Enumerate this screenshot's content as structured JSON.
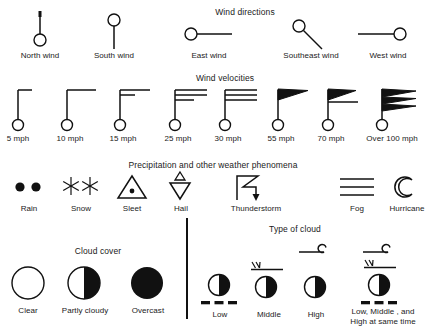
{
  "sections": [
    {
      "id": "wind-directions",
      "title": "Wind directions",
      "items": [
        {
          "id": "north-wind",
          "label": "North wind",
          "icon": "wind-direction-north-icon"
        },
        {
          "id": "south-wind",
          "label": "South wind",
          "icon": "wind-direction-south-icon"
        },
        {
          "id": "east-wind",
          "label": "East wind",
          "icon": "wind-direction-east-icon"
        },
        {
          "id": "southeast-wind",
          "label": "Southeast wind",
          "icon": "wind-direction-southeast-icon"
        },
        {
          "id": "west-wind",
          "label": "West wind",
          "icon": "wind-direction-west-icon"
        }
      ]
    },
    {
      "id": "wind-velocities",
      "title": "Wind velocities",
      "items": [
        {
          "id": "v5",
          "label": "5 mph",
          "icon": "wind-barb-5-icon"
        },
        {
          "id": "v10",
          "label": "10 mph",
          "icon": "wind-barb-10-icon"
        },
        {
          "id": "v15",
          "label": "15 mph",
          "icon": "wind-barb-15-icon"
        },
        {
          "id": "v25",
          "label": "25 mph",
          "icon": "wind-barb-25-icon"
        },
        {
          "id": "v30",
          "label": "30 mph",
          "icon": "wind-barb-30-icon"
        },
        {
          "id": "v55",
          "label": "55 mph",
          "icon": "wind-barb-55-icon"
        },
        {
          "id": "v70",
          "label": "70 mph",
          "icon": "wind-barb-70-icon"
        },
        {
          "id": "v100",
          "label": "Over 100 mph",
          "icon": "wind-barb-over-100-icon"
        }
      ]
    },
    {
      "id": "precipitation",
      "title": "Precipitation and other weather phenomena",
      "items": [
        {
          "id": "rain",
          "label": "Rain",
          "icon": "rain-icon"
        },
        {
          "id": "snow",
          "label": "Snow",
          "icon": "snow-icon"
        },
        {
          "id": "sleet",
          "label": "Sleet",
          "icon": "sleet-icon"
        },
        {
          "id": "hail",
          "label": "Hail",
          "icon": "hail-icon"
        },
        {
          "id": "thunderstorm",
          "label": "Thunderstorm",
          "icon": "thunderstorm-icon"
        },
        {
          "id": "fog",
          "label": "Fog",
          "icon": "fog-icon"
        },
        {
          "id": "hurricane",
          "label": "Hurricane",
          "icon": "hurricane-icon"
        }
      ]
    },
    {
      "id": "cloud-cover",
      "title": "Cloud cover",
      "items": [
        {
          "id": "clear",
          "label": "Clear",
          "icon": "cloud-cover-clear-icon"
        },
        {
          "id": "partly-cloudy",
          "label": "Partly cloudy",
          "icon": "cloud-cover-partly-cloudy-icon"
        },
        {
          "id": "overcast",
          "label": "Overcast",
          "icon": "cloud-cover-overcast-icon"
        }
      ]
    },
    {
      "id": "type-of-cloud",
      "title": "Type of cloud",
      "items": [
        {
          "id": "low",
          "label": "Low",
          "icon": "cloud-type-low-icon"
        },
        {
          "id": "middle",
          "label": "Middle",
          "icon": "cloud-type-middle-icon"
        },
        {
          "id": "high",
          "label": "High",
          "icon": "cloud-type-high-icon"
        },
        {
          "id": "all",
          "label_line1": "Low, Middle , and",
          "label_line2": "High at same time",
          "icon": "cloud-type-all-icon"
        }
      ]
    }
  ],
  "colors": {
    "ink": "#111111",
    "background": "#ffffff"
  }
}
